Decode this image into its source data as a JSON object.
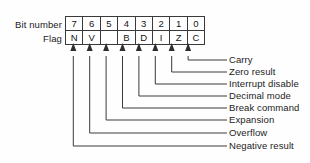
{
  "diagram": {
    "row_labels": {
      "bit_number": "Bit number",
      "flag": "Flag"
    },
    "bit_numbers": [
      "7",
      "6",
      "5",
      "4",
      "3",
      "2",
      "1",
      "0"
    ],
    "flags": [
      "N",
      "V",
      "",
      "B",
      "D",
      "I",
      "Z",
      "C"
    ],
    "callouts": [
      {
        "bit": "0",
        "flag": "C",
        "label": "Carry"
      },
      {
        "bit": "1",
        "flag": "Z",
        "label": "Zero result"
      },
      {
        "bit": "2",
        "flag": "I",
        "label": "Interrupt disable"
      },
      {
        "bit": "3",
        "flag": "D",
        "label": "Decimal mode"
      },
      {
        "bit": "4",
        "flag": "B",
        "label": "Break command"
      },
      {
        "bit": "5",
        "flag": "",
        "label": "Expansion"
      },
      {
        "bit": "6",
        "flag": "V",
        "label": "Overflow"
      },
      {
        "bit": "7",
        "flag": "N",
        "label": "Negative result"
      }
    ],
    "colors": {
      "ink": "#1c1c1c",
      "line": "#3a3a3a",
      "background": "#fefefe"
    }
  }
}
